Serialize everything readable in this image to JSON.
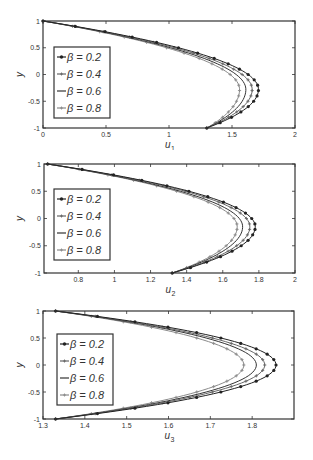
{
  "figure": {
    "background": "#ffffff",
    "frame_color": "#333333"
  },
  "legend_entries": [
    "β = 0.2",
    "β = 0.4",
    "β = 0.6",
    "β = 0.8"
  ],
  "series_styles": [
    {
      "color": "#222222",
      "marker": "dot"
    },
    {
      "color": "#666666",
      "marker": "plus"
    },
    {
      "color": "#333333",
      "marker": "none"
    },
    {
      "color": "#8a8a8a",
      "marker": "plus"
    }
  ],
  "chart_data": [
    {
      "type": "line",
      "title": "",
      "xlabel": "u1",
      "xlabel_main": "u",
      "xlabel_sub": "1",
      "ylabel": "y",
      "xlim": [
        0,
        2
      ],
      "ylim": [
        -1,
        1
      ],
      "xticks": [
        0,
        0.5,
        1,
        1.5,
        2
      ],
      "xtick_labels": [
        "0",
        "0.5",
        "1",
        "1.5",
        "2"
      ],
      "yticks": [
        -1,
        -0.5,
        0,
        0.5,
        1
      ],
      "ytick_labels": [
        "-1",
        "-0.5",
        "0",
        "0.5",
        "1"
      ],
      "grid": false,
      "legend_position": "center-left",
      "frame": {
        "left": 43,
        "top": 21,
        "right": 295,
        "bottom": 128
      },
      "legend_box": {
        "x": 54,
        "y": 47,
        "w": 56,
        "h": 71
      },
      "profile": {
        "u_top": 0.0,
        "u_bottom": 1.3
      },
      "series": [
        {
          "name": "β = 0.2",
          "u_max": 1.71,
          "y_at_max": -0.28
        },
        {
          "name": "β = 0.4",
          "u_max": 1.66,
          "y_at_max": -0.28
        },
        {
          "name": "β = 0.6",
          "u_max": 1.61,
          "y_at_max": -0.28
        },
        {
          "name": "β = 0.8",
          "u_max": 1.56,
          "y_at_max": -0.28
        }
      ]
    },
    {
      "type": "line",
      "title": "",
      "xlabel": "u2",
      "xlabel_main": "u",
      "xlabel_sub": "2",
      "ylabel": "y",
      "xlim": [
        0.61,
        2
      ],
      "ylim": [
        -1,
        1
      ],
      "xticks": [
        0.8,
        1,
        1.2,
        1.4,
        1.6,
        1.8,
        2
      ],
      "xtick_labels": [
        "0.8",
        "1",
        "1.2",
        "1.4",
        "1.6",
        "1.8",
        "2"
      ],
      "yticks": [
        -1,
        -0.5,
        0,
        0.5,
        1
      ],
      "ytick_labels": [
        "-1",
        "-0.5",
        "0",
        "0.5",
        "1"
      ],
      "grid": false,
      "legend_position": "center-left",
      "frame": {
        "left": 44,
        "top": 164,
        "right": 295,
        "bottom": 273
      },
      "legend_box": {
        "x": 54,
        "y": 189,
        "w": 56,
        "h": 71
      },
      "profile": {
        "u_top": 0.63,
        "u_bottom": 1.32
      },
      "series": [
        {
          "name": "β = 0.2",
          "u_max": 1.78,
          "y_at_max": -0.15
        },
        {
          "name": "β = 0.4",
          "u_max": 1.75,
          "y_at_max": -0.15
        },
        {
          "name": "β = 0.6",
          "u_max": 1.71,
          "y_at_max": -0.15
        },
        {
          "name": "β = 0.8",
          "u_max": 1.68,
          "y_at_max": -0.15
        }
      ]
    },
    {
      "type": "line",
      "title": "",
      "xlabel": "u3",
      "xlabel_main": "u",
      "xlabel_sub": "3",
      "ylabel": "y",
      "xlim": [
        1.3,
        1.9
      ],
      "ylim": [
        -1,
        1
      ],
      "xticks": [
        1.3,
        1.4,
        1.5,
        1.6,
        1.7,
        1.8
      ],
      "xtick_labels": [
        "1.3",
        "1.4",
        "1.5",
        "1.6",
        "1.7",
        "1.8"
      ],
      "yticks": [
        -1,
        -0.5,
        0,
        0.5,
        1
      ],
      "ytick_labels": [
        "-1",
        "-0.5",
        "0",
        "0.5",
        "1"
      ],
      "grid": false,
      "legend_position": "center-left",
      "frame": {
        "left": 43,
        "top": 311,
        "right": 294,
        "bottom": 419
      },
      "legend_box": {
        "x": 57,
        "y": 334,
        "w": 56,
        "h": 71
      },
      "profile": {
        "u_top": 1.33,
        "u_bottom": 1.33
      },
      "series": [
        {
          "name": "β = 0.2",
          "u_max": 1.857,
          "y_at_max": 0.0
        },
        {
          "name": "β = 0.4",
          "u_max": 1.83,
          "y_at_max": 0.0
        },
        {
          "name": "β = 0.6",
          "u_max": 1.81,
          "y_at_max": 0.0
        },
        {
          "name": "β = 0.8",
          "u_max": 1.78,
          "y_at_max": 0.0
        }
      ]
    }
  ]
}
